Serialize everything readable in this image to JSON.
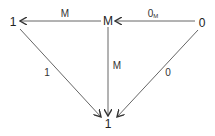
{
  "diagram": {
    "type": "commutative-diagram",
    "nodes": [
      {
        "id": "left",
        "label": "1"
      },
      {
        "id": "mid",
        "label": "M"
      },
      {
        "id": "right",
        "label": "0"
      },
      {
        "id": "bottom",
        "label": "1"
      }
    ],
    "edges": [
      {
        "from": "mid",
        "to": "left",
        "label": "M"
      },
      {
        "from": "right",
        "to": "mid",
        "label": "0",
        "label_sub": "M"
      },
      {
        "from": "left",
        "to": "bottom",
        "label": "1"
      },
      {
        "from": "mid",
        "to": "bottom",
        "label": "M"
      },
      {
        "from": "right",
        "to": "bottom",
        "label": "0"
      }
    ],
    "colors": {
      "arrow": "#555555",
      "text": "#222222"
    }
  }
}
